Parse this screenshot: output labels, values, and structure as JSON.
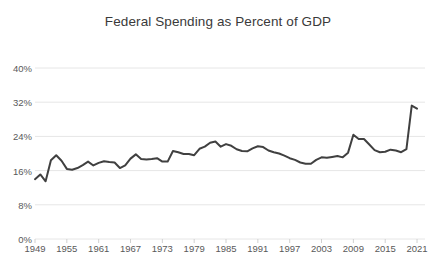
{
  "chart_data": {
    "type": "line",
    "title": "Federal Spending as Percent of GDP",
    "xlabel": "",
    "ylabel": "",
    "ylim": [
      0,
      40
    ],
    "xlim": [
      1949,
      2022.5
    ],
    "grid": true,
    "legend": null,
    "legend_position": "none",
    "y_ticks": [
      "0%",
      "8%",
      "16%",
      "24%",
      "32%",
      "40%"
    ],
    "y_tick_values": [
      0,
      8,
      16,
      24,
      32,
      40
    ],
    "x_ticks": [
      "1949",
      "1955",
      "1961",
      "1967",
      "1973",
      "1979",
      "1985",
      "1991",
      "1997",
      "2003",
      "2009",
      "2015",
      "2021"
    ],
    "x_tick_values": [
      1949,
      1955,
      1961,
      1967,
      1973,
      1979,
      1985,
      1991,
      1997,
      2003,
      2009,
      2015,
      2021
    ],
    "series": [
      {
        "name": "Federal Spending as Percent of GDP",
        "color": "#404040",
        "x": [
          1949,
          1950,
          1951,
          1952,
          1953,
          1954,
          1955,
          1956,
          1957,
          1958,
          1959,
          1960,
          1961,
          1962,
          1963,
          1964,
          1965,
          1966,
          1967,
          1968,
          1969,
          1970,
          1971,
          1972,
          1973,
          1974,
          1975,
          1976,
          1977,
          1978,
          1979,
          1980,
          1981,
          1982,
          1983,
          1984,
          1985,
          1986,
          1987,
          1988,
          1989,
          1990,
          1991,
          1992,
          1993,
          1994,
          1995,
          1996,
          1997,
          1998,
          1999,
          2000,
          2001,
          2002,
          2003,
          2004,
          2005,
          2006,
          2007,
          2008,
          2009,
          2010,
          2011,
          2012,
          2013,
          2014,
          2015,
          2016,
          2017,
          2018,
          2019,
          2020,
          2021
        ],
        "values": [
          14.0,
          15.1,
          13.5,
          18.4,
          19.6,
          18.3,
          16.4,
          16.2,
          16.6,
          17.3,
          18.1,
          17.2,
          17.8,
          18.2,
          18.0,
          17.9,
          16.6,
          17.2,
          18.8,
          19.8,
          18.7,
          18.6,
          18.7,
          18.9,
          18.1,
          18.1,
          20.6,
          20.3,
          19.9,
          19.9,
          19.6,
          21.1,
          21.6,
          22.5,
          22.8,
          21.6,
          22.2,
          21.8,
          21.0,
          20.6,
          20.5,
          21.2,
          21.7,
          21.5,
          20.7,
          20.3,
          20.0,
          19.5,
          18.9,
          18.5,
          17.9,
          17.6,
          17.6,
          18.5,
          19.1,
          19.0,
          19.2,
          19.4,
          19.1,
          20.2,
          24.4,
          23.4,
          23.4,
          22.1,
          20.8,
          20.3,
          20.4,
          20.9,
          20.7,
          20.3,
          21.0,
          31.2,
          30.5
        ]
      }
    ]
  }
}
